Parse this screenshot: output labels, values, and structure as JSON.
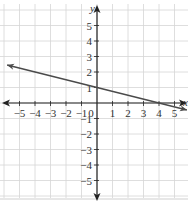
{
  "chart_data": {
    "type": "line",
    "title": "",
    "xlabel": "x",
    "ylabel": "y",
    "xlim": [
      -5.5,
      5.5
    ],
    "ylim": [
      -5.5,
      5.5
    ],
    "grid": true,
    "x_ticks": [
      "-5",
      "-4",
      "-3",
      "-2",
      "-1",
      "0",
      "1",
      "2",
      "3",
      "4",
      "5"
    ],
    "y_ticks": [
      "5",
      "4",
      "3",
      "2",
      "1",
      "-1",
      "-2",
      "-3",
      "-4",
      "-5"
    ],
    "series": [
      {
        "name": "line",
        "equation": "y = -1/4 x + 1",
        "x": [
          -5.8,
          0,
          4,
          5.8
        ],
        "y": [
          2.45,
          1,
          0,
          -0.45
        ],
        "arrows": "both"
      }
    ],
    "annotations": [
      "y-intercept at (0, 1)",
      "x-intercept at (4, 0)"
    ]
  },
  "colors": {
    "grid": "#d6d6d6",
    "axis": "#222222",
    "line": "#4a4a4a",
    "label": "#333333"
  }
}
